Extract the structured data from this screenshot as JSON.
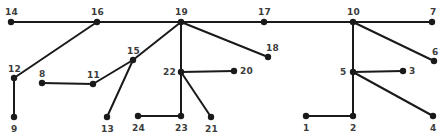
{
  "graph": {
    "type": "node-link-diagram",
    "background_color": "#ffffff",
    "edge_color": "#1a1a1a",
    "node_color": "#1a1a1a",
    "label_color": "#3c3c3c",
    "edge_width": 2,
    "node_radius": 3.2,
    "nodes": [
      {
        "id": "1",
        "label": "1",
        "x": 306,
        "y": 116,
        "label_dx": -3,
        "label_dy": 8
      },
      {
        "id": "2",
        "label": "2",
        "x": 353,
        "y": 116,
        "label_dx": -3,
        "label_dy": 8
      },
      {
        "id": "3",
        "label": "3",
        "x": 403,
        "y": 71,
        "label_dx": 6,
        "label_dy": -4
      },
      {
        "id": "4",
        "label": "4",
        "x": 433,
        "y": 116,
        "label_dx": -3,
        "label_dy": 8
      },
      {
        "id": "5",
        "label": "5",
        "x": 353,
        "y": 72,
        "label_dx": -13,
        "label_dy": -4
      },
      {
        "id": "6",
        "label": "6",
        "x": 434,
        "y": 61,
        "label_dx": -2,
        "label_dy": -13
      },
      {
        "id": "7",
        "label": "7",
        "x": 432,
        "y": 22,
        "label_dx": -2,
        "label_dy": -14
      },
      {
        "id": "8",
        "label": "8",
        "x": 42,
        "y": 83,
        "label_dx": -3,
        "label_dy": -13
      },
      {
        "id": "9",
        "label": "9",
        "x": 14,
        "y": 117,
        "label_dx": -3,
        "label_dy": 8
      },
      {
        "id": "10",
        "label": "10",
        "x": 353,
        "y": 22,
        "label_dx": -6,
        "label_dy": -14
      },
      {
        "id": "11",
        "label": "11",
        "x": 93,
        "y": 84,
        "label_dx": -6,
        "label_dy": -13
      },
      {
        "id": "12",
        "label": "12",
        "x": 14,
        "y": 78,
        "label_dx": -6,
        "label_dy": -13
      },
      {
        "id": "13",
        "label": "13",
        "x": 107,
        "y": 117,
        "label_dx": -6,
        "label_dy": 8
      },
      {
        "id": "14",
        "label": "14",
        "x": 11,
        "y": 22,
        "label_dx": -6,
        "label_dy": -14
      },
      {
        "id": "15",
        "label": "15",
        "x": 133,
        "y": 60,
        "label_dx": -6,
        "label_dy": -13
      },
      {
        "id": "16",
        "label": "16",
        "x": 97,
        "y": 22,
        "label_dx": -6,
        "label_dy": -14
      },
      {
        "id": "17",
        "label": "17",
        "x": 264,
        "y": 22,
        "label_dx": -6,
        "label_dy": -14
      },
      {
        "id": "18",
        "label": "18",
        "x": 268,
        "y": 57,
        "label_dx": -2,
        "label_dy": -13
      },
      {
        "id": "19",
        "label": "19",
        "x": 181,
        "y": 22,
        "label_dx": -6,
        "label_dy": -14
      },
      {
        "id": "20",
        "label": "20",
        "x": 234,
        "y": 71,
        "label_dx": 6,
        "label_dy": -4
      },
      {
        "id": "21",
        "label": "21",
        "x": 211,
        "y": 117,
        "label_dx": -6,
        "label_dy": 8
      },
      {
        "id": "22",
        "label": "22",
        "x": 181,
        "y": 72,
        "label_dx": -18,
        "label_dy": -4
      },
      {
        "id": "23",
        "label": "23",
        "x": 181,
        "y": 116,
        "label_dx": -6,
        "label_dy": 8
      },
      {
        "id": "24",
        "label": "24",
        "x": 138,
        "y": 116,
        "label_dx": -6,
        "label_dy": 8
      }
    ],
    "edges": [
      {
        "source": "14",
        "target": "16"
      },
      {
        "source": "16",
        "target": "19"
      },
      {
        "source": "19",
        "target": "17"
      },
      {
        "source": "17",
        "target": "10"
      },
      {
        "source": "10",
        "target": "7"
      },
      {
        "source": "16",
        "target": "12"
      },
      {
        "source": "12",
        "target": "9"
      },
      {
        "source": "8",
        "target": "11"
      },
      {
        "source": "11",
        "target": "15"
      },
      {
        "source": "15",
        "target": "19"
      },
      {
        "source": "15",
        "target": "13"
      },
      {
        "source": "19",
        "target": "22"
      },
      {
        "source": "19",
        "target": "18"
      },
      {
        "source": "22",
        "target": "20"
      },
      {
        "source": "22",
        "target": "23"
      },
      {
        "source": "22",
        "target": "21"
      },
      {
        "source": "24",
        "target": "23"
      },
      {
        "source": "10",
        "target": "5"
      },
      {
        "source": "10",
        "target": "6"
      },
      {
        "source": "5",
        "target": "3"
      },
      {
        "source": "5",
        "target": "2"
      },
      {
        "source": "5",
        "target": "4"
      },
      {
        "source": "1",
        "target": "2"
      }
    ]
  }
}
